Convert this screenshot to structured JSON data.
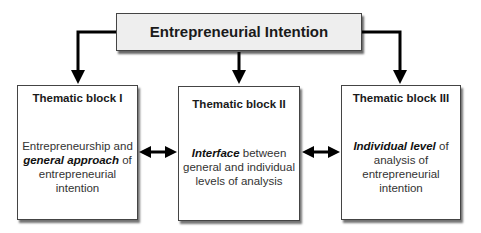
{
  "root": {
    "label": "Entrepreneurial Intention"
  },
  "blocks": [
    {
      "title": "Thematic block I",
      "lines": [
        {
          "pre": "Entrepreneurship and",
          "em": "",
          "post": ""
        },
        {
          "pre": "",
          "em": "general approach",
          "post": " of"
        },
        {
          "pre": "entrepreneurial intention",
          "em": "",
          "post": ""
        }
      ]
    },
    {
      "title": "Thematic block II",
      "lines": [
        {
          "pre": "",
          "em": "Interface",
          "post": " between"
        },
        {
          "pre": "general and individual",
          "em": "",
          "post": ""
        },
        {
          "pre": "levels of analysis",
          "em": "",
          "post": ""
        }
      ]
    },
    {
      "title": "Thematic block III",
      "lines": [
        {
          "pre": "",
          "em": "Individual level",
          "post": " of"
        },
        {
          "pre": "analysis of",
          "em": "",
          "post": ""
        },
        {
          "pre": "entrepreneurial intention",
          "em": "",
          "post": ""
        }
      ]
    }
  ],
  "connectors": {
    "root_to_blocks": "one-way arrows",
    "between_blocks": "two-way arrows"
  }
}
